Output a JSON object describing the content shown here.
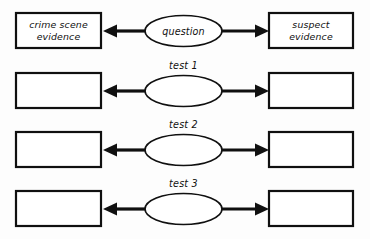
{
  "diagram": {
    "style": "hand-drawn worksheet",
    "colors": {
      "background": "#fdfdfd",
      "stroke": "#101010",
      "fill": "#ffffff",
      "text": "#111111"
    },
    "rows": [
      {
        "id": "row-question",
        "label": "",
        "left_box": "crime scene\nevidence",
        "left_box_line1": "crime scene",
        "left_box_line2": "evidence",
        "center_ellipse": "question",
        "right_box": "suspect\nevidence",
        "right_box_line1": "suspect",
        "right_box_line2": "evidence"
      },
      {
        "id": "row-test-1",
        "label": "test 1",
        "left_box": "",
        "left_box_line1": "",
        "left_box_line2": "",
        "center_ellipse": "",
        "right_box": "",
        "right_box_line1": "",
        "right_box_line2": ""
      },
      {
        "id": "row-test-2",
        "label": "test 2",
        "left_box": "",
        "left_box_line1": "",
        "left_box_line2": "",
        "center_ellipse": "",
        "right_box": "",
        "right_box_line1": "",
        "right_box_line2": ""
      },
      {
        "id": "row-test-3",
        "label": "test 3",
        "left_box": "",
        "left_box_line1": "",
        "left_box_line2": "",
        "center_ellipse": "",
        "right_box": "",
        "right_box_line1": "",
        "right_box_line2": ""
      }
    ]
  }
}
